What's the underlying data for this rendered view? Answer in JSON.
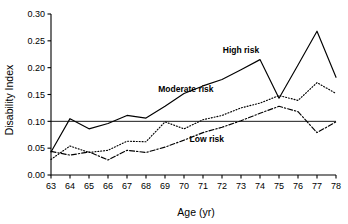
{
  "chart_data": {
    "type": "line",
    "title": "",
    "xlabel": "Age (yr)",
    "ylabel": "Disability Index",
    "x": [
      63,
      64,
      65,
      66,
      67,
      68,
      69,
      70,
      71,
      72,
      73,
      74,
      75,
      76,
      77,
      78
    ],
    "xlim": [
      63,
      78
    ],
    "ylim": [
      0.0,
      0.3
    ],
    "xticks": [
      "63",
      "64",
      "65",
      "66",
      "67",
      "68",
      "69",
      "70",
      "71",
      "72",
      "73",
      "74",
      "75",
      "76",
      "77",
      "78"
    ],
    "yticks": [
      "0.00",
      "0.05",
      "0.10",
      "0.15",
      "0.20",
      "0.25",
      "0.30"
    ],
    "grid": false,
    "legend_position": "inline-annotations",
    "reference_line": {
      "label": "0.10 reference",
      "value": 0.1,
      "orientation": "horizontal"
    },
    "series": [
      {
        "name": "High risk",
        "style": "solid",
        "label_x": 73,
        "label_y": 0.228,
        "values": [
          0.043,
          0.105,
          0.086,
          0.096,
          0.111,
          0.106,
          0.128,
          0.152,
          0.166,
          0.178,
          0.196,
          0.215,
          0.143,
          0.205,
          0.268,
          0.182
        ]
      },
      {
        "name": "Moderate risk",
        "style": "dotted",
        "label_x": 70.1,
        "label_y": 0.154,
        "values": [
          0.029,
          0.054,
          0.042,
          0.046,
          0.063,
          0.062,
          0.099,
          0.086,
          0.103,
          0.111,
          0.125,
          0.134,
          0.148,
          0.139,
          0.172,
          0.152
        ]
      },
      {
        "name": "Low risk",
        "style": "dashdot",
        "label_x": 71.2,
        "label_y": 0.062,
        "values": [
          0.044,
          0.037,
          0.043,
          0.028,
          0.046,
          0.042,
          0.052,
          0.065,
          0.079,
          0.089,
          0.101,
          0.115,
          0.128,
          0.118,
          0.079,
          0.099
        ]
      }
    ]
  }
}
